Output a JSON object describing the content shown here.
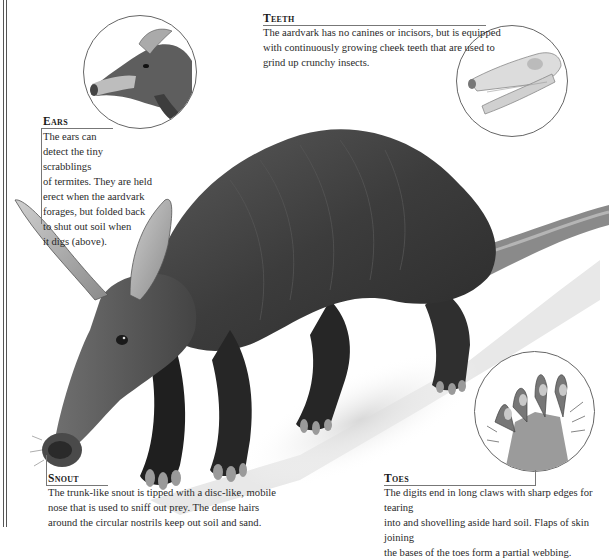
{
  "captions": {
    "teeth": {
      "heading": "Teeth",
      "lines": [
        "The aardvark has no canines or incisors, but is equipped",
        "with continuously growing cheek teeth that are used to",
        "grind up crunchy insects."
      ]
    },
    "ears": {
      "heading": "Ears",
      "lines": [
        "The ears can",
        "detect the tiny scrabblings",
        "of termites. They are held",
        "erect when the aardvark",
        "forages, but folded back",
        "to shut out soil when",
        "it digs (above)."
      ]
    },
    "snout": {
      "heading": "Snout",
      "lines": [
        "The trunk-like snout is tipped with a disc-like, mobile",
        "nose that is used to sniff out prey. The dense hairs",
        "around the circular nostrils keep out soil and sand."
      ]
    },
    "toes": {
      "heading": "Toes",
      "lines": [
        "The digits end in long claws with sharp edges for tearing",
        "into and shovelling aside hard soil. Flaps of skin joining",
        "the bases of the toes form a partial webbing."
      ]
    }
  },
  "illustrations": {
    "main": "aardvark-full-body",
    "insets": [
      "aardvark-head-ears-folded",
      "aardvark-skull",
      "aardvark-forefoot-underside"
    ]
  },
  "colors": {
    "rule": "#777777",
    "text": "#2a2a2a",
    "fur_dark": "#3a3a3a",
    "fur_mid": "#6b6b6b",
    "skin_light": "#b5b5b5",
    "ground": "#e6e6e6"
  }
}
